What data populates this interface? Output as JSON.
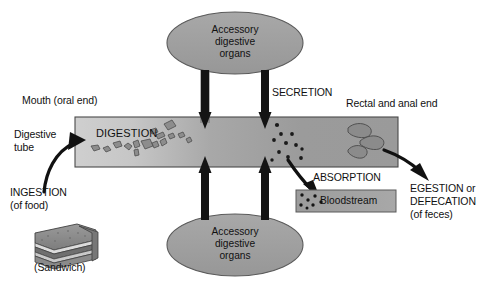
{
  "figure": {
    "title_cut_off": "g system",
    "background_color": "#ffffff",
    "tube_fill_light": "#c9c9c9",
    "tube_fill_dark": "#9a9a9a",
    "organ_ellipse_fill": "#9e9e9e",
    "bloodstream_fill": "#a3a3a3",
    "outline_color": "#3a3a3a",
    "arrow_color": "#111111",
    "text_color": "#111111"
  },
  "labels": {
    "mouth": "Mouth (oral end)",
    "digestive_tube_line1": "Digestive",
    "digestive_tube_line2": "tube",
    "ingestion_line1": "INGESTION",
    "ingestion_line2": "(of food)",
    "sandwich_caption": "(Sandwich)",
    "digestion": "DIGESTION",
    "secretion": "SECRETION",
    "absorption": "ABSORPTION",
    "bloodstream": "Bloodstream",
    "rectal_end": "Rectal and anal end",
    "egestion_line1": "EGESTION or",
    "egestion_line2": "DEFECATION",
    "egestion_line3": "(of feces)"
  },
  "organs_top": {
    "line1": "Accessory",
    "line2": "digestive",
    "line3": "organs"
  },
  "organs_bottom": {
    "line1": "Accessory",
    "line2": "digestive",
    "line3": "organs"
  },
  "icons": {
    "ingestion_arrow": "curved-arrow-right-icon",
    "secretion_arrow_down_left": "arrow-down-icon",
    "secretion_arrow_down_right": "arrow-down-icon",
    "absorption_arrow_up_left": "arrow-up-icon",
    "absorption_arrow_up_right": "arrow-up-icon",
    "absorption_curved_arrow": "curved-arrow-down-icon",
    "egestion_arrow": "curved-arrow-down-right-icon",
    "sandwich": "sandwich-icon",
    "food_particles": "food-particle-icon",
    "nutrient_dots": "nutrient-dot-icon",
    "feces": "feces-icon"
  },
  "diagram_data": {
    "type": "flow-diagram",
    "subject": "Overview of the digestive system",
    "stages": [
      {
        "name": "INGESTION",
        "detail": "(of food)",
        "position": "left / oral end"
      },
      {
        "name": "DIGESTION",
        "detail": "breakdown of food particles",
        "position": "upper digestive tube"
      },
      {
        "name": "SECRETION",
        "detail": "from accessory digestive organs into tube",
        "position": "middle, downward arrows"
      },
      {
        "name": "ABSORPTION",
        "detail": "nutrients pass into Bloodstream",
        "position": "middle-right"
      },
      {
        "name": "EGESTION or DEFECATION",
        "detail": "(of feces)",
        "position": "right / rectal and anal end"
      }
    ],
    "structures": [
      {
        "name": "Digestive tube",
        "shape": "horizontal band",
        "shading": "light to dark gradient left-to-right"
      },
      {
        "name": "Accessory digestive organs",
        "shape": "ellipse",
        "count": 2,
        "position": "top and bottom"
      },
      {
        "name": "Bloodstream",
        "shape": "rectangle",
        "position": "lower middle-right"
      }
    ],
    "flows": [
      {
        "from": "Mouth (oral end)",
        "to": "Digestive tube",
        "label": "INGESTION"
      },
      {
        "from": "Accessory digestive organs (top)",
        "to": "Digestive tube",
        "label": "SECRETION",
        "direction": "down"
      },
      {
        "from": "Accessory digestive organs (bottom)",
        "to": "Digestive tube",
        "label": "SECRETION",
        "direction": "up"
      },
      {
        "from": "Digestive tube",
        "to": "Bloodstream",
        "label": "ABSORPTION"
      },
      {
        "from": "Digestive tube",
        "to": "outside body",
        "label": "EGESTION or DEFECATION"
      }
    ]
  }
}
